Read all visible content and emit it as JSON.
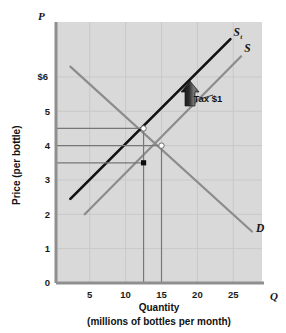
{
  "chart_data": {
    "type": "line",
    "title": "",
    "xlabel": "Quantity",
    "xlabel_sub": "(millions of bottles per month)",
    "ylabel": "Price (per bottle)",
    "x_axis_symbol": "Q",
    "y_axis_symbol": "P",
    "xlim": [
      0.3,
      29
    ],
    "ylim": [
      0,
      7.6
    ],
    "grid": true,
    "xticks": [
      5,
      10,
      15,
      20,
      25
    ],
    "xtick_labels": [
      "5",
      "10",
      "15",
      "20",
      "25"
    ],
    "yticks": [
      0,
      1,
      2,
      3,
      4,
      5,
      6
    ],
    "ytick_labels": [
      "0",
      "1",
      "2",
      "3",
      "4",
      "5",
      "6"
    ],
    "ytick_label_six": "$6",
    "legend_position": "inline-curve-ends",
    "series": [
      {
        "name": "D",
        "label": "D",
        "role": "demand",
        "color": "#8c8c8c",
        "points": [
          [
            2.3,
            6.3
          ],
          [
            27.6,
            1.5
          ]
        ]
      },
      {
        "name": "S",
        "label": "S",
        "role": "supply",
        "color": "#8c8c8c",
        "points": [
          [
            4.3,
            2.0
          ],
          [
            26.1,
            6.6
          ]
        ]
      },
      {
        "name": "St",
        "label": "S",
        "label_subscript": "t",
        "role": "supply-with-tax",
        "color": "#111111",
        "points": [
          [
            2.3,
            2.45
          ],
          [
            24.6,
            7.1
          ]
        ]
      }
    ],
    "markers": [
      {
        "name": "equilibrium-with-tax",
        "x": 12.5,
        "y": 4.5,
        "style": "open-circle"
      },
      {
        "name": "equilibrium-original",
        "x": 15.0,
        "y": 4.0,
        "style": "open-circle"
      },
      {
        "name": "seller-net-price-point",
        "x": 12.5,
        "y": 3.5,
        "style": "filled-square"
      }
    ],
    "reference_lines": {
      "horizontal": [
        {
          "name": "price-buyers-pay",
          "y": 4.5,
          "x_from": 0.3,
          "x_to": 12.5
        },
        {
          "name": "price-original-equilibrium",
          "y": 4.0,
          "x_from": 0.3,
          "x_to": 15.0
        },
        {
          "name": "price-sellers-receive",
          "y": 3.5,
          "x_from": 0.3,
          "x_to": 12.5
        }
      ],
      "vertical": [
        {
          "name": "quantity-with-tax",
          "x": 12.5,
          "y_from": 0,
          "y_to": 4.5
        },
        {
          "name": "quantity-original",
          "x": 15.0,
          "y_from": 0,
          "y_to": 4.0
        }
      ]
    },
    "annotations": [
      {
        "name": "tax-arrow",
        "label": "Tax $1",
        "x": 20.0,
        "y": 5.35,
        "arrow": "up-block"
      }
    ]
  },
  "colors": {
    "plot_background": "#d9d9d9",
    "page_background": "#ffffff",
    "grid": "#c9c9c9",
    "axis": "#8f8f8f",
    "curve_gray": "#8c8c8c",
    "curve_black": "#111111",
    "reference_line": "#777777",
    "text": "#141414"
  }
}
